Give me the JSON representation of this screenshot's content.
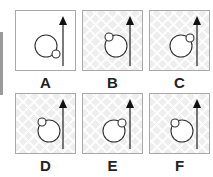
{
  "colors": {
    "stroke": "#333333",
    "border": "#a8a8a8"
  },
  "options": [
    {
      "label": "A",
      "background": "plain",
      "big_circle": {
        "cx": 30,
        "cy": 35,
        "r": 11
      },
      "small_circle": {
        "cx": 40,
        "cy": 43,
        "r": 4
      },
      "arrow": "arrow-up-icon"
    },
    {
      "label": "B",
      "background": "pattern",
      "big_circle": {
        "cx": 33,
        "cy": 35,
        "r": 11
      },
      "small_circle": {
        "cx": 26,
        "cy": 26,
        "r": 4
      },
      "arrow": "arrow-up-icon"
    },
    {
      "label": "C",
      "background": "pattern",
      "big_circle": {
        "cx": 31,
        "cy": 35,
        "r": 11
      },
      "small_circle": {
        "cx": 40,
        "cy": 27,
        "r": 4
      },
      "arrow": "arrow-up-icon"
    },
    {
      "label": "D",
      "background": "pattern",
      "big_circle": {
        "cx": 33,
        "cy": 37,
        "r": 11
      },
      "small_circle": {
        "cx": 26,
        "cy": 28,
        "r": 4
      },
      "arrow": "arrow-up-icon"
    },
    {
      "label": "E",
      "background": "pattern",
      "big_circle": {
        "cx": 31,
        "cy": 37,
        "r": 11
      },
      "small_circle": {
        "cx": 39,
        "cy": 29,
        "r": 4
      },
      "arrow": "arrow-up-icon"
    },
    {
      "label": "F",
      "background": "pattern",
      "big_circle": {
        "cx": 32,
        "cy": 37,
        "r": 11
      },
      "small_circle": {
        "cx": 25,
        "cy": 29,
        "r": 4
      },
      "arrow": "arrow-up-icon"
    }
  ]
}
